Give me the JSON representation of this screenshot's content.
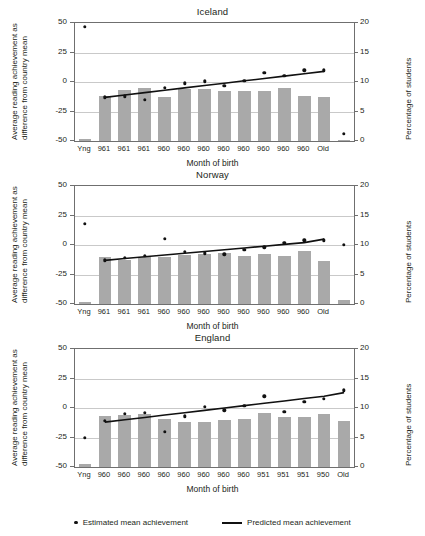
{
  "axis_titles": {
    "left_line1": "Average reading achievement as",
    "left_line2": "difference from country mean",
    "right": "Percentage of students",
    "x": "Month of birth"
  },
  "legend": {
    "estimated": "Estimated mean achievement",
    "predicted": "Predicted mean achievement"
  },
  "colors": {
    "bar": "#a9a9a9",
    "dot": "#111111",
    "line": "#111111",
    "grid": "#c9c9c9",
    "frame": "#6f6f6f"
  },
  "chart_data": [
    {
      "type": "bar",
      "title": "Iceland",
      "xlabel": "Month of birth",
      "ylabel": "Average reading achievement as difference from country mean",
      "y2label": "Percentage of students",
      "ylim": [
        -50,
        50
      ],
      "y2lim": [
        0,
        20
      ],
      "yticks": [
        -50,
        -25,
        0,
        25,
        50
      ],
      "y2ticks": [
        0,
        5,
        10,
        15,
        20
      ],
      "grid": true,
      "categories": [
        "Yng",
        "961",
        "961",
        "961",
        "960",
        "960",
        "960",
        "960",
        "960",
        "960",
        "960",
        "960",
        "Old",
        ""
      ],
      "series": [
        {
          "name": "Percentage of students",
          "type": "bar",
          "axis": "right",
          "values": [
            0.3,
            7.6,
            8.6,
            9.0,
            7.5,
            8.9,
            8.8,
            8.5,
            8.5,
            8.5,
            9.0,
            7.7,
            7.4,
            0.2
          ]
        },
        {
          "name": "Estimated mean achievement",
          "type": "scatter",
          "axis": "left",
          "values": [
            47,
            -13,
            -12,
            -15,
            -5,
            -1,
            0.5,
            -3,
            1,
            8,
            5,
            10,
            10,
            -44
          ]
        },
        {
          "name": "Predicted mean achievement",
          "type": "line",
          "axis": "left",
          "values": [
            null,
            -13,
            -11,
            -9,
            -7,
            -5,
            -3,
            -1,
            1,
            3,
            5,
            7,
            9,
            null
          ]
        }
      ]
    },
    {
      "type": "bar",
      "title": "Norway",
      "xlabel": "Month of birth",
      "ylabel": "Average reading achievement as difference from country mean",
      "y2label": "Percentage of students",
      "ylim": [
        -50,
        50
      ],
      "y2lim": [
        0,
        20
      ],
      "yticks": [
        -50,
        -25,
        0,
        25,
        50
      ],
      "y2ticks": [
        0,
        5,
        10,
        15,
        20
      ],
      "grid": true,
      "categories": [
        "Yng",
        "961",
        "961",
        "961",
        "960",
        "960",
        "960",
        "960",
        "960",
        "960",
        "960",
        "960",
        "Old",
        ""
      ],
      "series": [
        {
          "name": "Percentage of students",
          "type": "bar",
          "axis": "right",
          "values": [
            0.3,
            8.0,
            7.4,
            8.0,
            7.9,
            8.3,
            8.5,
            8.6,
            8.2,
            8.4,
            8.2,
            9.0,
            7.3,
            0.6
          ]
        },
        {
          "name": "Estimated mean achievement",
          "type": "scatter",
          "axis": "left",
          "values": [
            18,
            -13,
            -11,
            -9,
            5,
            -6,
            -7,
            -8,
            -4,
            -2,
            2,
            4,
            4,
            0
          ]
        },
        {
          "name": "Predicted mean achievement",
          "type": "line",
          "axis": "left",
          "values": [
            null,
            -13,
            -11.5,
            -10,
            -8.5,
            -7,
            -5.5,
            -4,
            -2.5,
            -1,
            0.5,
            2,
            5,
            null
          ]
        }
      ]
    },
    {
      "type": "bar",
      "title": "England",
      "xlabel": "Month of birth",
      "ylabel": "Average reading achievement as difference from country mean",
      "y2label": "Percentage of students",
      "ylim": [
        -50,
        50
      ],
      "y2lim": [
        0,
        20
      ],
      "yticks": [
        -50,
        -25,
        0,
        25,
        50
      ],
      "y2ticks": [
        0,
        5,
        10,
        15,
        20
      ],
      "grid": true,
      "categories": [
        "Yng",
        "960",
        "960",
        "960",
        "960",
        "960",
        "960",
        "960",
        "960",
        "951",
        "951",
        "951",
        "950",
        "Old"
      ],
      "series": [
        {
          "name": "Percentage of students",
          "type": "bar",
          "axis": "right",
          "values": [
            0.5,
            8.6,
            8.8,
            9.0,
            8.2,
            7.6,
            7.6,
            8.0,
            8.2,
            9.1,
            8.4,
            8.4,
            9.0,
            7.8
          ]
        },
        {
          "name": "Estimated mean achievement",
          "type": "scatter",
          "axis": "left",
          "values": [
            -25,
            -11,
            -5,
            -4,
            -20,
            -7,
            1,
            -2,
            2,
            10,
            -3,
            5,
            8,
            15
          ]
        },
        {
          "name": "Predicted mean achievement",
          "type": "line",
          "axis": "left",
          "values": [
            null,
            -12,
            -10,
            -8,
            -6,
            -4,
            -2,
            0,
            2,
            4,
            6,
            8,
            10,
            13
          ]
        }
      ]
    }
  ]
}
